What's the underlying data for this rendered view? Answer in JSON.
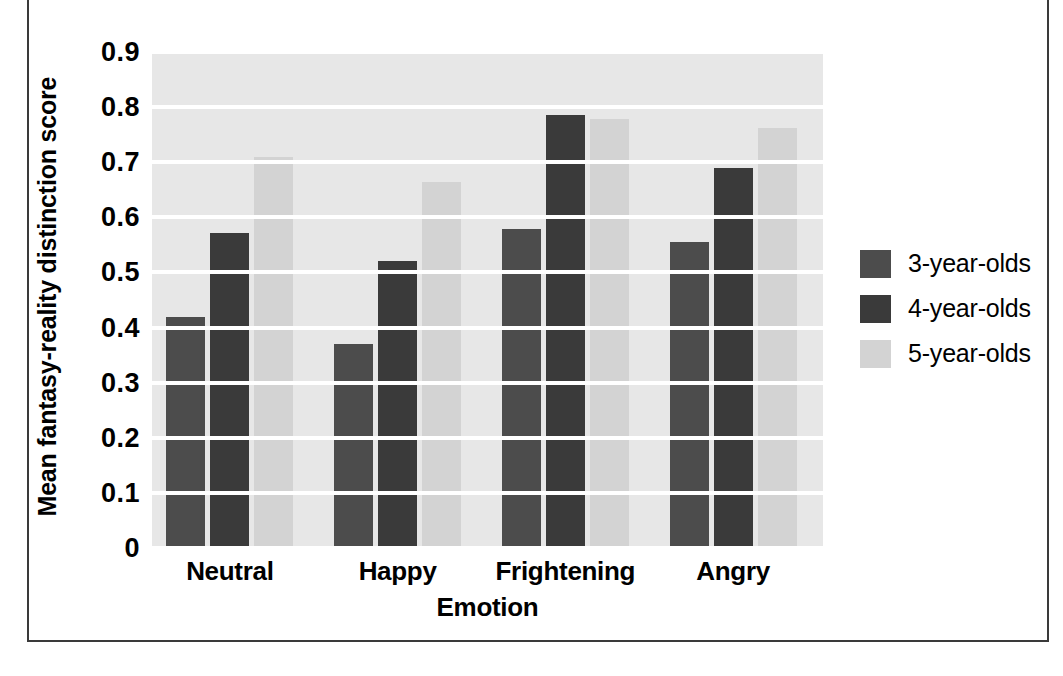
{
  "chart_data": {
    "type": "bar",
    "title": "",
    "xlabel": "Emotion",
    "ylabel": "Mean fantasy-reality distinction score",
    "categories": [
      "Neutral",
      "Happy",
      "Frightening",
      "Angry"
    ],
    "series": [
      {
        "name": "3-year-olds",
        "color": "#4c4c4c",
        "values": [
          0.42,
          0.37,
          0.578,
          0.555
        ]
      },
      {
        "name": "4-year-olds",
        "color": "#3a3a3a",
        "values": [
          0.571,
          0.52,
          0.785,
          0.69
        ]
      },
      {
        "name": "5-year-olds",
        "color": "#d3d3d3",
        "values": [
          0.71,
          0.665,
          0.778,
          0.762
        ]
      }
    ],
    "ylim": [
      0,
      0.9
    ],
    "ytick_labels": [
      "0.9",
      "0.8",
      "0.7",
      "0.6",
      "0.5",
      "0.4",
      "0.3",
      "0.2",
      "0.1",
      "0"
    ],
    "ytick_values": [
      0.9,
      0.8,
      0.7,
      0.6,
      0.5,
      0.4,
      0.3,
      0.2,
      0.1,
      0
    ],
    "grid": "horizontal-white",
    "plot_background": "#e7e7e7",
    "legend_position": "right"
  },
  "legend": {
    "entries": [
      {
        "label": "3-year-olds"
      },
      {
        "label": "4-year-olds"
      },
      {
        "label": "5-year-olds"
      }
    ]
  },
  "axes": {
    "x_title": "Emotion",
    "y_title": "Mean fantasy-reality distinction score"
  }
}
